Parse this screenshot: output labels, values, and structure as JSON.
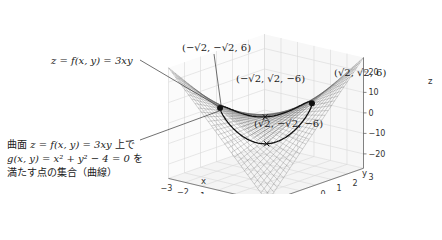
{
  "chart_data": {
    "type": "surface3d",
    "title": "",
    "surface": {
      "equation": "z = f(x, y) = 3xy",
      "x_range": [
        -3,
        3
      ],
      "y_range": [
        -3,
        3
      ],
      "style": "wireframe",
      "color": "#555555"
    },
    "constraint_curve": {
      "equation": "g(x, y) = x^2 + y^2 - 4 = 0",
      "description": "circle of radius 2 lifted onto the surface",
      "color": "#111111"
    },
    "points": [
      {
        "label": "(−√2, −√2, 6)",
        "x": -1.414,
        "y": -1.414,
        "z": 6,
        "marker": "dot"
      },
      {
        "label": "(√2, √2, 6)",
        "x": 1.414,
        "y": 1.414,
        "z": 6,
        "marker": "dot"
      },
      {
        "label": "(−√2, √2, −6)",
        "x": -1.414,
        "y": 1.414,
        "z": -6,
        "marker": "x"
      },
      {
        "label": "(√2, −√2, −6)",
        "x": 1.414,
        "y": -1.414,
        "z": -6,
        "marker": "x"
      }
    ],
    "axes": {
      "x": {
        "label": "x",
        "ticks": [
          "−3",
          "−2",
          "−1",
          "0",
          "1",
          "2",
          "3"
        ],
        "range": [
          -3,
          3
        ]
      },
      "y": {
        "label": "y",
        "ticks": [
          "−3",
          "−2",
          "−1",
          "0",
          "1",
          "2",
          "3"
        ],
        "range": [
          -3,
          3
        ]
      },
      "z": {
        "label": "z",
        "ticks": [
          "20",
          "10",
          "0",
          "−10",
          "−20"
        ],
        "range": [
          -27,
          27
        ]
      }
    },
    "grid": true,
    "annotations": [
      {
        "text": "z = f(x, y) = 3xy",
        "target": "surface"
      },
      {
        "lines": [
          "曲面 z = f(x, y) = 3xy 上で",
          "g(x, y) = x² + y² − 4 = 0 を",
          "満たす点の集合（曲線）"
        ],
        "target": "constraint_curve"
      }
    ]
  },
  "labels": {
    "surface_label": "z = f(x, y) = 3xy",
    "curve_label_line1_prefix": "曲面 ",
    "curve_label_line1_math": "z = f(x, y) = 3xy",
    "curve_label_line1_suffix": " 上で",
    "curve_label_line2_math": "g(x, y) = x² + y² − 4 = 0",
    "curve_label_line2_suffix": " を",
    "curve_label_line3": "満たす点の集合（曲線）",
    "pt_mm": "(−√2, −√2, 6)",
    "pt_pp": "(√2, √2, 6)",
    "pt_mp": "(−√2, √2, −6)",
    "pt_pm": "(√2, −√2, −6)",
    "x_axis_label": "x",
    "y_axis_label": "y",
    "z_axis_label": "z",
    "x_ticks": [
      "−3",
      "−2",
      "−1",
      "0",
      "1",
      "2",
      "3"
    ],
    "y_ticks": [
      "−3",
      "−2",
      "−1",
      "0",
      "1",
      "2",
      "3"
    ],
    "z_ticks": [
      "20",
      "10",
      "0",
      "−10",
      "−20"
    ]
  }
}
